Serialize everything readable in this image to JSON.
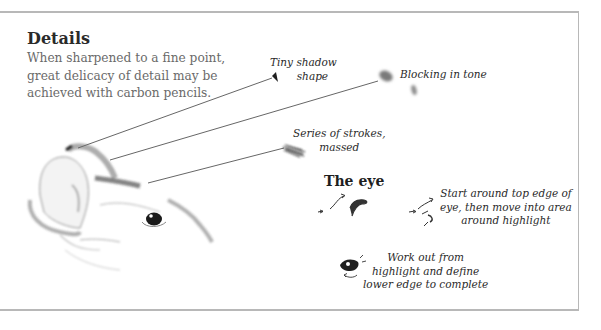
{
  "section": {
    "title": "Details",
    "intro": "When sharpened to a fine point, great delicacy of detail may be achieved with carbon pencils."
  },
  "annotations": [
    {
      "id": "tiny-shadow",
      "lines": [
        "Tiny shadow",
        "shape"
      ]
    },
    {
      "id": "blocking-tone",
      "lines": [
        "Blocking in tone"
      ]
    },
    {
      "id": "series-strokes",
      "lines": [
        "Series of strokes,",
        "massed"
      ]
    }
  ],
  "eye": {
    "heading": "The eye",
    "steps": [
      {
        "id": "step-start",
        "lines": [
          "Start around top edge of",
          "eye, then move into area",
          "around highlight"
        ]
      },
      {
        "id": "step-work-out",
        "lines": [
          "Work out from",
          "highlight and define",
          "lower edge to complete"
        ]
      }
    ]
  },
  "illustration": {
    "subject": "pencil sketch of animal head (ear and eye)",
    "icons": [
      "ear-sketch",
      "animal-eye-sketch",
      "shadow-mark",
      "tone-smudge",
      "stroke-mass",
      "eye-stroke-step1",
      "eye-stroke-step2",
      "eye-complete-step3"
    ]
  },
  "colors": {
    "border": "#b8b8b8",
    "heading": "#2a2a2a",
    "body_text": "#6a6a6a",
    "pencil": "#3a3a3a"
  }
}
